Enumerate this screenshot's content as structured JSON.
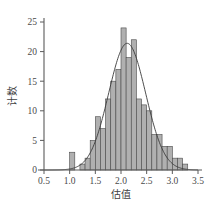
{
  "figure": {
    "title": "",
    "background_color": "#ffffff",
    "axis_color": "#5a5a5a",
    "bar_fill_color": "#b0b0b0",
    "bar_edge_color": "#4a4a4a",
    "curve_color": "#3a3a3a"
  },
  "chart_data": {
    "type": "bar",
    "title": "",
    "subtitle": "",
    "xlabel": "估值",
    "ylabel": "计数",
    "xlim": [
      0.5,
      3.5
    ],
    "ylim": [
      0,
      25
    ],
    "xticks": [
      0.5,
      1.0,
      1.5,
      2.0,
      2.5,
      3.0,
      3.5
    ],
    "xtick_labels": [
      "0.5",
      "1.0",
      "1.5",
      "2.0",
      "2.5",
      "3.0",
      "3.5"
    ],
    "yticks": [
      0,
      5,
      10,
      15,
      20,
      25
    ],
    "ytick_labels": [
      "0",
      "5",
      "10",
      "15",
      "20",
      "25"
    ],
    "grid": false,
    "legend": null,
    "bin_width": 0.1,
    "bin_starts": [
      1.0,
      1.1,
      1.2,
      1.3,
      1.4,
      1.5,
      1.6,
      1.7,
      1.8,
      1.9,
      2.0,
      2.1,
      2.2,
      2.3,
      2.4,
      2.5,
      2.6,
      2.7,
      2.8,
      2.9,
      3.0,
      3.1,
      3.2
    ],
    "categories": [
      "1.00",
      "1.10",
      "1.20",
      "1.30",
      "1.40",
      "1.50",
      "1.60",
      "1.70",
      "1.80",
      "1.90",
      "2.00",
      "2.10",
      "2.20",
      "2.30",
      "2.40",
      "2.50",
      "2.60",
      "2.70",
      "2.80",
      "2.90",
      "3.00",
      "3.10",
      "3.20"
    ],
    "values": [
      3,
      0,
      1,
      2,
      5,
      9,
      7,
      12,
      15,
      17,
      24,
      19,
      22,
      12,
      11,
      10,
      6,
      6,
      4,
      4,
      2,
      2,
      1
    ],
    "overlay_curve": {
      "name": "normal-fit",
      "type": "line",
      "mean": 2.12,
      "peak_value": 21.4,
      "sigma": 0.36,
      "x_start": 0.5,
      "x_end": 3.5
    }
  }
}
